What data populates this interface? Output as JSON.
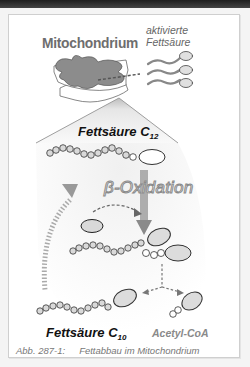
{
  "diagram": {
    "title": "Mitochondrium",
    "activated_fatty_acid_label_line1": "aktivierte",
    "activated_fatty_acid_label_line2": "Fettsäure",
    "fatty_acid_c12_label": "Fettsäure C",
    "fatty_acid_c12_subscript": "12",
    "process_label": "β-Oxidation",
    "fatty_acid_c10_label": "Fettsäure C",
    "fatty_acid_c10_subscript": "10",
    "product_label": "Acetyl-CoA",
    "caption_number": "Abb. 287-1:",
    "caption_text": "Fettabbau im Mitochondrium"
  },
  "colors": {
    "mitochondrion_fill": "#8c8c8c",
    "coa_fill": "#d8d8d8",
    "arrow_gray": "#9a9a9a",
    "background_cone": "#ececec",
    "frame_border": "#cfcfcf"
  }
}
